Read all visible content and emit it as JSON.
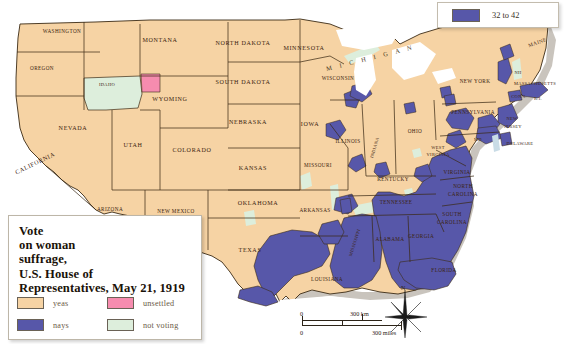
{
  "map": {
    "title_lines": [
      "Vote",
      "on woman",
      "suffrage,",
      "U.S. House of",
      "Representatives, May 21, 1919"
    ],
    "legend": [
      {
        "key": "yeas",
        "label": "yeas",
        "color": "#F6D3A4"
      },
      {
        "key": "unsettled",
        "label": "unsettled",
        "color": "#F68CAF"
      },
      {
        "key": "nays",
        "label": "nays",
        "color": "#5757A9"
      },
      {
        "key": "not_voting",
        "label": "not voting",
        "color": "#DDEEDC"
      }
    ],
    "inset_key": {
      "label": "32 to 42",
      "color": "#5757A9"
    },
    "scale": {
      "km_zero": "0",
      "km_max": "300 km",
      "mi_zero": "0",
      "mi_max": "300 miles"
    },
    "compass": {
      "north": "N"
    },
    "colors": {
      "yeas": "#F6D3A4",
      "nays": "#5757A9",
      "unsettled": "#F68CAF",
      "not_voting": "#DDEEDC",
      "water": "#C9DCE6",
      "border": "#3B2A14",
      "coast_shadow": "#BFBAB2",
      "background": "#FFFFFF"
    },
    "state_labels": [
      {
        "name": "WASHINGTON",
        "x": 62,
        "y": 33,
        "size": "sm",
        "rot": 0
      },
      {
        "name": "OREGON",
        "x": 42,
        "y": 70,
        "size": "sm",
        "rot": 0
      },
      {
        "name": "IDAHO",
        "x": 107,
        "y": 86,
        "size": "xs",
        "rot": 0
      },
      {
        "name": "MONTANA",
        "x": 160,
        "y": 42,
        "size": "norm",
        "rot": 0
      },
      {
        "name": "NORTH DAKOTA",
        "x": 243,
        "y": 45,
        "size": "norm",
        "rot": 0
      },
      {
        "name": "SOUTH DAKOTA",
        "x": 243,
        "y": 84,
        "size": "norm",
        "rot": 0
      },
      {
        "name": "MINNESOTA",
        "x": 304,
        "y": 50,
        "size": "norm",
        "rot": 0
      },
      {
        "name": "WISCONSIN",
        "x": 338,
        "y": 80,
        "size": "sm",
        "rot": 0
      },
      {
        "name": "M I C H I G A N",
        "x": 371,
        "y": 60,
        "size": "lake",
        "rot": -14
      },
      {
        "name": "WYOMING",
        "x": 170,
        "y": 101,
        "size": "norm",
        "rot": 0
      },
      {
        "name": "NEBRASKA",
        "x": 248,
        "y": 124,
        "size": "norm",
        "rot": 0
      },
      {
        "name": "IOWA",
        "x": 310,
        "y": 126,
        "size": "norm",
        "rot": 0
      },
      {
        "name": "NEVADA",
        "x": 73,
        "y": 130,
        "size": "norm",
        "rot": 0
      },
      {
        "name": "UTAH",
        "x": 133,
        "y": 147,
        "size": "norm",
        "rot": 0
      },
      {
        "name": "COLORADO",
        "x": 192,
        "y": 152,
        "size": "norm",
        "rot": 0
      },
      {
        "name": "KANSAS",
        "x": 253,
        "y": 170,
        "size": "norm",
        "rot": 0
      },
      {
        "name": "MISSOURI",
        "x": 318,
        "y": 167,
        "size": "sm",
        "rot": 0
      },
      {
        "name": "ILLINOIS",
        "x": 348,
        "y": 143,
        "size": "sm",
        "rot": 0
      },
      {
        "name": "INDIANA",
        "x": 376,
        "y": 148,
        "size": "xs",
        "rot": -74
      },
      {
        "name": "OHIO",
        "x": 415,
        "y": 133,
        "size": "sm",
        "rot": 0
      },
      {
        "name": "WEST",
        "x": 438,
        "y": 149,
        "size": "xs",
        "rot": 0
      },
      {
        "name": "VIRGINIA",
        "x": 438,
        "y": 156,
        "size": "xs",
        "rot": 0
      },
      {
        "name": "CALIFORNIA",
        "x": 36,
        "y": 165,
        "size": "norm",
        "rot": -26
      },
      {
        "name": "ARIZONA",
        "x": 110,
        "y": 211,
        "size": "sm",
        "rot": 0
      },
      {
        "name": "NEW MEXICO",
        "x": 176,
        "y": 213,
        "size": "sm",
        "rot": 0
      },
      {
        "name": "OKLAHOMA",
        "x": 258,
        "y": 205,
        "size": "norm",
        "rot": 0
      },
      {
        "name": "ARKANSAS",
        "x": 315,
        "y": 212,
        "size": "sm",
        "rot": 0
      },
      {
        "name": "TEXAS",
        "x": 250,
        "y": 252,
        "size": "norm",
        "rot": 0
      },
      {
        "name": "LOUISIANA",
        "x": 327,
        "y": 281,
        "size": "sm",
        "rot": 0
      },
      {
        "name": "MISSISSIPPI",
        "x": 356,
        "y": 243,
        "size": "xs",
        "rot": -72
      },
      {
        "name": "KENTUCKY",
        "x": 393,
        "y": 181,
        "size": "sm",
        "rot": 0
      },
      {
        "name": "TENNESSEE",
        "x": 396,
        "y": 204,
        "size": "sm",
        "rot": 0
      },
      {
        "name": "ALABAMA",
        "x": 390,
        "y": 241,
        "size": "sm",
        "rot": 0
      },
      {
        "name": "GEORGIA",
        "x": 421,
        "y": 238,
        "size": "sm",
        "rot": 0
      },
      {
        "name": "VIRGINIA",
        "x": 457,
        "y": 174,
        "size": "sm",
        "rot": 0
      },
      {
        "name": "NORTH",
        "x": 463,
        "y": 188,
        "size": "sm",
        "rot": 0
      },
      {
        "name": "CAROLINA",
        "x": 463,
        "y": 196,
        "size": "sm",
        "rot": 0
      },
      {
        "name": "SOUTH",
        "x": 452,
        "y": 216,
        "size": "sm",
        "rot": 0
      },
      {
        "name": "CAROLINA",
        "x": 452,
        "y": 224,
        "size": "sm",
        "rot": 0
      },
      {
        "name": "FLORIDA",
        "x": 444,
        "y": 272,
        "size": "sm",
        "rot": 0
      },
      {
        "name": "MAINE",
        "x": 538,
        "y": 44,
        "size": "sm",
        "rot": -20
      },
      {
        "name": "NH",
        "x": 518,
        "y": 74,
        "size": "xs",
        "rot": 0
      },
      {
        "name": "NEW YORK",
        "x": 475,
        "y": 83,
        "size": "sm",
        "rot": 0
      },
      {
        "name": "MASSACHUSETTS",
        "x": 535,
        "y": 85,
        "size": "xs",
        "rot": 0
      },
      {
        "name": "CONN.",
        "x": 519,
        "y": 98,
        "size": "xs",
        "rot": 0
      },
      {
        "name": "R.I.",
        "x": 538,
        "y": 100,
        "size": "xs",
        "rot": 0
      },
      {
        "name": "PENNSYLVANIA",
        "x": 473,
        "y": 114,
        "size": "sm",
        "rot": 0
      },
      {
        "name": "NEW",
        "x": 512,
        "y": 120,
        "size": "xs",
        "rot": 0
      },
      {
        "name": "JERSEY",
        "x": 513,
        "y": 128,
        "size": "xs",
        "rot": 0
      },
      {
        "name": "MD",
        "x": 478,
        "y": 141,
        "size": "xs",
        "rot": 0
      },
      {
        "name": "DELAWARE",
        "x": 520,
        "y": 145,
        "size": "xs",
        "rot": 0
      }
    ]
  }
}
